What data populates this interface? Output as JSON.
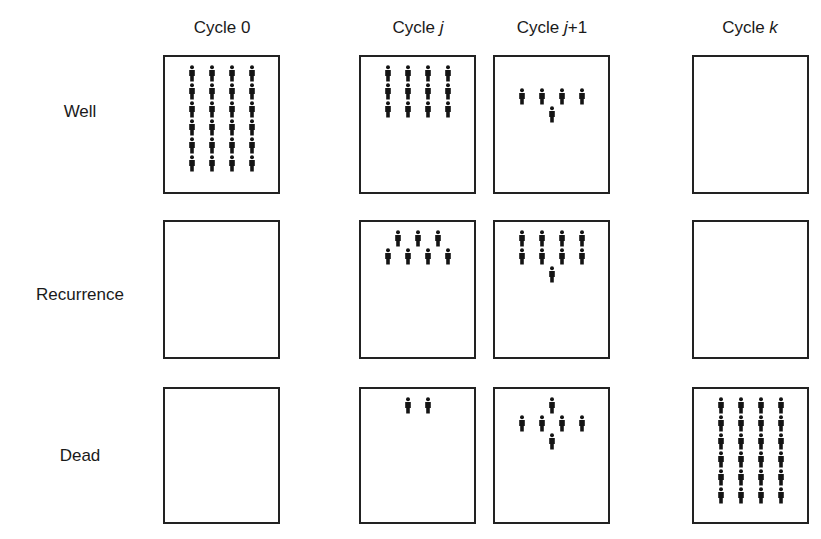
{
  "columns": [
    {
      "id": "cycle0",
      "label_prefix": "Cycle ",
      "label_var": "0",
      "var_italic": false,
      "label_suffix": ""
    },
    {
      "id": "cyclej",
      "label_prefix": "Cycle ",
      "label_var": "j",
      "var_italic": true,
      "label_suffix": ""
    },
    {
      "id": "cyclej1",
      "label_prefix": "Cycle ",
      "label_var": "j",
      "var_italic": true,
      "label_suffix": "+1"
    },
    {
      "id": "cyclek",
      "label_prefix": "Cycle ",
      "label_var": "k",
      "var_italic": true,
      "label_suffix": ""
    }
  ],
  "rows": [
    {
      "id": "well",
      "label": "Well"
    },
    {
      "id": "recurrence",
      "label": "Recurrence"
    },
    {
      "id": "dead",
      "label": "Dead"
    }
  ],
  "icon": "person-icon",
  "colors": {
    "figure": "#141414",
    "border": "#222222",
    "text": "#1a1a1a"
  },
  "cells": {
    "well": {
      "cycle0": {
        "count": 24,
        "pattern": [
          4,
          4,
          4,
          4,
          4,
          4
        ]
      },
      "cyclej": {
        "count": 12,
        "pattern": [
          4,
          4,
          4
        ]
      },
      "cyclej1": {
        "count": 5,
        "pattern": [
          4,
          1
        ]
      },
      "cyclek": {
        "count": 0,
        "pattern": []
      }
    },
    "recurrence": {
      "cycle0": {
        "count": 0,
        "pattern": []
      },
      "cyclej": {
        "count": 7,
        "pattern": [
          3,
          4
        ]
      },
      "cyclej1": {
        "count": 9,
        "pattern": [
          4,
          4,
          1
        ]
      },
      "cyclek": {
        "count": 0,
        "pattern": []
      }
    },
    "dead": {
      "cycle0": {
        "count": 0,
        "pattern": []
      },
      "cyclej": {
        "count": 2,
        "pattern": [
          2
        ]
      },
      "cyclej1": {
        "count": 6,
        "pattern": [
          1,
          4,
          1
        ]
      },
      "cyclek": {
        "count": 24,
        "pattern": [
          4,
          4,
          4,
          4,
          4,
          4
        ]
      }
    }
  }
}
